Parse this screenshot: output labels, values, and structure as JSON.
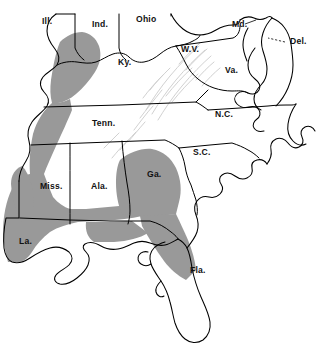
{
  "map": {
    "title": "",
    "background_color": "#ffffff",
    "outline_color": "#000000",
    "shaded_region_color": "#999999",
    "relief_color": "#c9c9c9",
    "label_color": "#111111",
    "state_labels": [
      {
        "id": "illinois",
        "abbr": "Ill.",
        "x": 42,
        "y": 24
      },
      {
        "id": "indiana",
        "abbr": "Ind.",
        "x": 92,
        "y": 27
      },
      {
        "id": "ohio",
        "abbr": "Ohio",
        "x": 136,
        "y": 22
      },
      {
        "id": "maryland",
        "abbr": "Md.",
        "x": 232,
        "y": 27
      },
      {
        "id": "delaware",
        "abbr": "Del.",
        "x": 290,
        "y": 44
      },
      {
        "id": "west-virginia",
        "abbr": "W.V.",
        "x": 181,
        "y": 52
      },
      {
        "id": "virginia",
        "abbr": "Va.",
        "x": 225,
        "y": 73
      },
      {
        "id": "kentucky",
        "abbr": "Ky.",
        "x": 118,
        "y": 65
      },
      {
        "id": "tennessee",
        "abbr": "Tenn.",
        "x": 92,
        "y": 126
      },
      {
        "id": "north-carolina",
        "abbr": "N.C.",
        "x": 215,
        "y": 117
      },
      {
        "id": "south-carolina",
        "abbr": "S.C.",
        "x": 193,
        "y": 155
      },
      {
        "id": "mississippi",
        "abbr": "Miss.",
        "x": 40,
        "y": 189
      },
      {
        "id": "alabama",
        "abbr": "Ala.",
        "x": 91,
        "y": 189
      },
      {
        "id": "georgia",
        "abbr": "Ga.",
        "x": 147,
        "y": 177
      },
      {
        "id": "louisiana",
        "abbr": "La.",
        "x": 19,
        "y": 244
      },
      {
        "id": "florida",
        "abbr": "Fla.",
        "x": 190,
        "y": 273
      }
    ],
    "legend": {
      "shaded_meaning": "shaded distribution range"
    }
  }
}
